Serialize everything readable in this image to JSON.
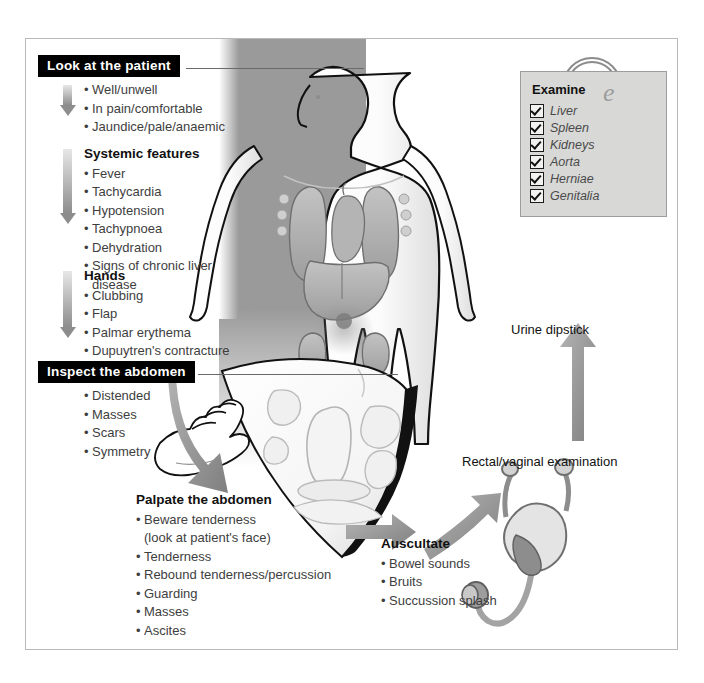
{
  "diagram": {
    "frame_border_color": "#b9b9b9",
    "panel_gray": "#9a9a9a",
    "arrow_gray": "#8d8d8d"
  },
  "look": {
    "header": "Look at the patient",
    "items": [
      "Well/unwell",
      "In pain/comfortable",
      "Jaundice/pale/anaemic"
    ]
  },
  "systemic": {
    "heading": "Systemic features",
    "items": [
      "Fever",
      "Tachycardia",
      "Hypotension",
      "Tachypnoea",
      "Dehydration",
      "Signs of chronic liver",
      "disease"
    ]
  },
  "hands": {
    "heading": "Hands",
    "items": [
      "Clubbing",
      "Flap",
      "Palmar erythema",
      "Dupuytren's contracture"
    ]
  },
  "inspect": {
    "header": "Inspect the abdomen",
    "items": [
      "Distended",
      "Masses",
      "Scars",
      "Symmetry"
    ]
  },
  "palpate": {
    "heading": "Palpate the abdomen",
    "items": [
      "Beware tenderness",
      "Tenderness",
      "Rebound tenderness/percussion",
      "Guarding",
      "Masses",
      "Ascites"
    ],
    "subnote": "(look at patient's face)"
  },
  "auscultate": {
    "heading": "Auscultate",
    "items": [
      "Bowel sounds",
      "Bruits",
      "Succussion splash"
    ]
  },
  "examine": {
    "title": "Examine",
    "ghost_letter": "e",
    "items": [
      "Liver",
      "Spleen",
      "Kidneys",
      "Aorta",
      "Herniae",
      "Genitalia"
    ]
  },
  "right_labels": {
    "urine": "Urine dipstick",
    "rectal": "Rectal/vaginal examination"
  },
  "icons": {
    "magnifier": "magnifier-icon",
    "stethoscope": "stethoscope-icon",
    "hand": "hand-icon",
    "body": "human-body-icon"
  }
}
